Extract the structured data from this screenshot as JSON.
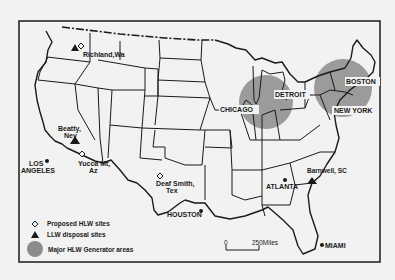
{
  "map": {
    "background_color": "#f2f2f2",
    "frame_color": "#1a1a1a",
    "generator_area_color": "#8c8c8c",
    "cities": [
      {
        "name": "LOS ANGELES",
        "line1": "LOS",
        "line2": "ANGELES",
        "marker": "dot"
      },
      {
        "name": "HOUSTON",
        "line1": "HOUSTON",
        "marker": "dot"
      },
      {
        "name": "ATLANTA",
        "line1": "ATLANTA",
        "marker": "dot"
      },
      {
        "name": "MIAMI",
        "line1": "MIAMI",
        "marker": "dot"
      },
      {
        "name": "CHICAGO",
        "line1": "CHICAGO",
        "marker": "none"
      },
      {
        "name": "DETROIT",
        "line1": "DETROIT",
        "marker": "none"
      },
      {
        "name": "BOSTON",
        "line1": "BOSTON",
        "marker": "none"
      },
      {
        "name": "NEW YORK",
        "line1": "NEW YORK",
        "marker": "none"
      }
    ],
    "sites": [
      {
        "name": "Richland, Wa",
        "line1": "Richland,Wa",
        "markers": [
          "triangle",
          "diamond"
        ]
      },
      {
        "name": "Beatty, Nev",
        "line1": "Beatty,",
        "line2": "Nev",
        "markers": [
          "triangle"
        ]
      },
      {
        "name": "Yucca Mt, Az",
        "line1": "Yucca Mt,",
        "line2": "Az",
        "markers": [
          "diamond"
        ]
      },
      {
        "name": "Deaf Smith, Tex",
        "line1": "Deaf Smith,",
        "line2": "Tex",
        "markers": [
          "diamond"
        ]
      },
      {
        "name": "Barnwell, SC",
        "line1": "Barnwell, SC",
        "markers": [
          "triangle"
        ]
      }
    ],
    "generator_areas": [
      "Chicago-Detroit",
      "Boston-New York"
    ],
    "legend": {
      "items": [
        {
          "symbol": "diamond",
          "label": "Proposed HLW sites"
        },
        {
          "symbol": "triangle",
          "label": "LLW disposal sites"
        },
        {
          "symbol": "circle",
          "label": "Major HLW Generator areas"
        }
      ]
    },
    "scale_bar": {
      "start": "0",
      "end": "250Miles"
    }
  }
}
